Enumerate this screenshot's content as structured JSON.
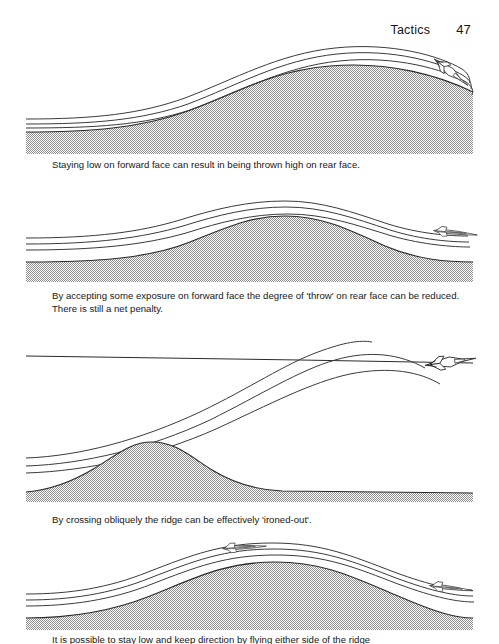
{
  "header": {
    "title": "Tactics",
    "page_number": "47"
  },
  "panels": [
    {
      "id": "panel-1",
      "caption": "Staying low on forward face can result in being thrown high on rear face.",
      "aircraft_count": 1,
      "terrain": "single large ridge, steep rear face",
      "flight_paths": 3
    },
    {
      "id": "panel-2",
      "caption": "By accepting some exposure on forward face the degree of 'throw' on rear face can be reduced. There is still a net penalty.",
      "aircraft_count": 1,
      "terrain": "single symmetric ridge",
      "flight_paths": 3
    },
    {
      "id": "panel-3",
      "caption": "By crossing obliquely the ridge can be effectively 'ironed-out'.",
      "aircraft_count": 1,
      "terrain": "small ridge with flat ground to the right, straight horizon line",
      "flight_paths": 3
    },
    {
      "id": "panel-4",
      "caption": "It is possible to stay low and keep direction by flying either side of the ridge",
      "aircraft_count": 2,
      "terrain": "single broad ridge",
      "flight_paths": 3
    }
  ],
  "colors": {
    "ink": "#1a1a1a",
    "terrain_fill": "#b4b4b4",
    "terrain_edge": "#2a2a2a",
    "paper": "#ffffff",
    "path_line": "#3a3a3a"
  },
  "icons": {
    "aircraft": "delta-wing-jet-icon"
  }
}
